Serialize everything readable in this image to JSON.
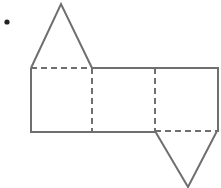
{
  "diagram": {
    "type": "net-of-triangular-prism",
    "stroke_color": "#6f6f6f",
    "bullet": {
      "cx": 7,
      "cy": 22,
      "r": 2.5
    },
    "top_triangle": {
      "points": "31,68 61,4 92,68"
    },
    "rectangle": {
      "x1": 31,
      "y1": 68,
      "x2": 218,
      "y2": 132
    },
    "dashed_lines": [
      {
        "x1": 31,
        "y1": 68,
        "x2": 92,
        "y2": 68
      },
      {
        "x1": 92,
        "y1": 68,
        "x2": 92,
        "y2": 132
      },
      {
        "x1": 155,
        "y1": 68,
        "x2": 155,
        "y2": 131
      },
      {
        "x1": 155,
        "y1": 131,
        "x2": 217,
        "y2": 131
      }
    ],
    "bottom_triangle": {
      "points": "155,131 188,187 217,131"
    }
  }
}
